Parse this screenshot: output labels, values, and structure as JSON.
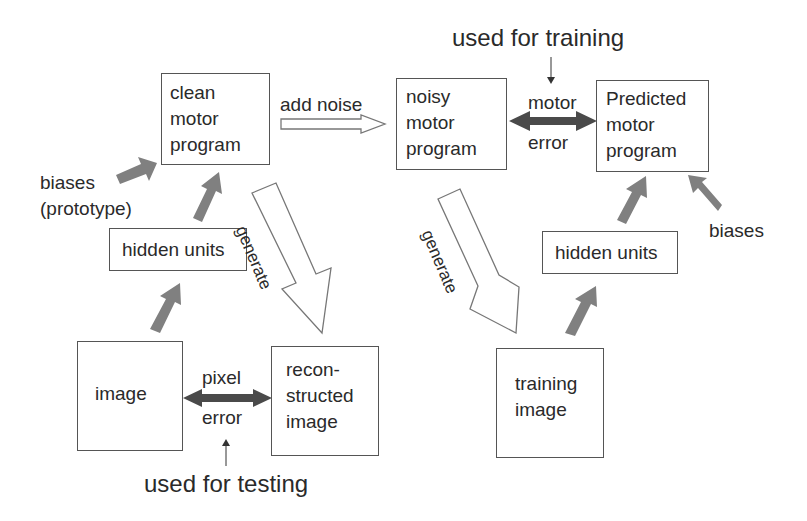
{
  "annotations": {
    "used_for_training": "used for training",
    "used_for_testing": "used for testing"
  },
  "left": {
    "clean_motor_program": "clean\nmotor\nprogram",
    "biases": "biases\n(prototype)",
    "hidden_units": "hidden units",
    "image": "image",
    "pixel_error_top": "pixel",
    "pixel_error_bottom": "error",
    "reconstructed_image": "recon-\nstructed\nimage",
    "generate": "generate"
  },
  "middle": {
    "add_noise": "add noise"
  },
  "right": {
    "noisy_motor_program": "noisy\nmotor\nprogram",
    "motor_error_top": "motor",
    "motor_error_bottom": "error",
    "predicted_motor_program": "Predicted\nmotor\nprogram",
    "biases": "biases",
    "hidden_units": "hidden units",
    "training_image": "training\nimage",
    "generate": "generate"
  },
  "colors": {
    "box_border": "#555555",
    "solid_arrow": "#808080",
    "double_arrow": "#4a4a4a",
    "text": "#2a2a2a"
  }
}
